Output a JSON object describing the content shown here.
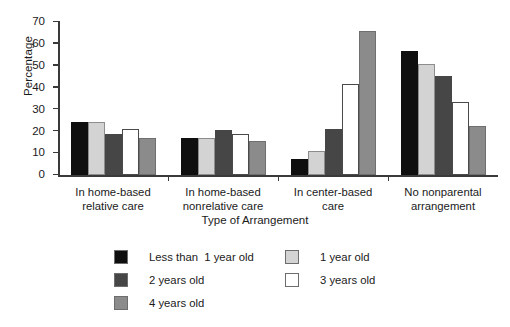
{
  "chart_data": {
    "type": "bar",
    "title": "",
    "xlabel": "Type of Arrangement",
    "ylabel": "Percentage",
    "ylim": [
      0,
      70
    ],
    "ytick_labels": [
      "0",
      "10",
      "20",
      "30",
      "40",
      "50",
      "60",
      "70"
    ],
    "ytick_values": [
      0,
      10,
      20,
      30,
      40,
      50,
      60,
      70
    ],
    "grid": false,
    "legend_position": "below-plot",
    "categories": [
      "In home-based relative care",
      "In home-based nonrelative care",
      "In center-based care",
      "No nonparental arrangement"
    ],
    "category_lines": [
      [
        "In home-based",
        "relative care"
      ],
      [
        "In home-based",
        "nonrelative care"
      ],
      [
        "In center-based",
        "care"
      ],
      [
        "No nonparental",
        "arrangement"
      ]
    ],
    "series": [
      {
        "name": "Less than  1 year old",
        "color": "#100f10",
        "values": [
          24.3,
          16.8,
          7.5,
          56.6
        ]
      },
      {
        "name": "1 year old",
        "color": "#d3d3d3",
        "values": [
          24.3,
          16.9,
          11.0,
          50.8
        ]
      },
      {
        "name": "2 years old",
        "color": "#464646",
        "values": [
          18.9,
          20.5,
          21.0,
          45.3
        ]
      },
      {
        "name": "3 years old",
        "color": "#ffffff",
        "values": [
          21.0,
          18.6,
          41.5,
          33.2
        ]
      },
      {
        "name": "4 years old",
        "color": "#8b8b8b",
        "values": [
          17.0,
          15.5,
          66.0,
          22.2
        ]
      }
    ]
  },
  "legend": {
    "entries": [
      {
        "label": "Less than  1 year old",
        "swatch": "#100f10",
        "column": 0,
        "row": 0
      },
      {
        "label": "1 year old",
        "swatch": "#d3d3d3",
        "column": 1,
        "row": 0
      },
      {
        "label": "2 years old",
        "swatch": "#464646",
        "column": 0,
        "row": 1
      },
      {
        "label": "3 years old",
        "swatch": "#ffffff",
        "column": 1,
        "row": 1
      },
      {
        "label": "4 years old",
        "swatch": "#8b8b8b",
        "column": 0,
        "row": 2
      }
    ]
  }
}
